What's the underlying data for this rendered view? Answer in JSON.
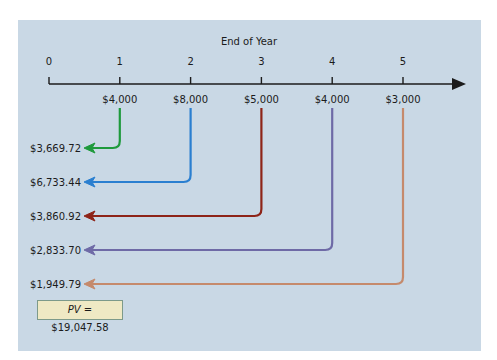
{
  "diagram": {
    "axis_title": "End of Year",
    "periods": [
      "0",
      "1",
      "2",
      "3",
      "4",
      "5"
    ],
    "cash_flows": [
      {
        "year": 1,
        "amount": "$4,000",
        "present_value": "$3,669.72",
        "color": "#1e9a3c"
      },
      {
        "year": 2,
        "amount": "$8,000",
        "present_value": "$6,733.44",
        "color": "#2a7fd0"
      },
      {
        "year": 3,
        "amount": "$5,000",
        "present_value": "$3,860.92",
        "color": "#8e2418"
      },
      {
        "year": 4,
        "amount": "$4,000",
        "present_value": "$2,833.70",
        "color": "#6e6aa6"
      },
      {
        "year": 5,
        "amount": "$3,000",
        "present_value": "$1,949.79",
        "color": "#c58a6c"
      }
    ],
    "pv_label": "PV",
    "pv_value": "= $19,047.58",
    "colors": {
      "panel": "#c9d8e5",
      "axis": "#1b1b1b",
      "pv_box": "#efe9c4"
    }
  }
}
